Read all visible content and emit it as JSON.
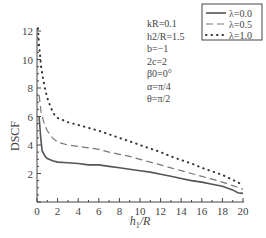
{
  "chart_data": {
    "type": "line",
    "title": "",
    "xlabel": "h1/R",
    "ylabel": "DSCF",
    "xlim": [
      0,
      20
    ],
    "ylim": [
      0,
      12
    ],
    "xticks": [
      0,
      2,
      4,
      6,
      8,
      10,
      12,
      14,
      16,
      18,
      20
    ],
    "yticks": [
      2,
      4,
      6,
      8,
      10,
      12
    ],
    "grid": false,
    "legend_position": "upper right",
    "annotations": [
      "kR=0.1",
      "h2/R=1.5",
      "b=−1",
      "2c=2",
      "β0=0°",
      "α=π/4",
      "θ=π/2"
    ],
    "series": [
      {
        "name": "λ=0.0",
        "style": "solid",
        "x": [
          0.2,
          0.35,
          0.5,
          0.8,
          1,
          1.5,
          2,
          3,
          4,
          5,
          6,
          7,
          8,
          9,
          10,
          11,
          12,
          13,
          14,
          15,
          16,
          17,
          18,
          19,
          19.5,
          20
        ],
        "y": [
          6.0,
          4.6,
          3.6,
          3.2,
          3.05,
          2.9,
          2.8,
          2.75,
          2.7,
          2.6,
          2.6,
          2.5,
          2.4,
          2.3,
          2.2,
          2.1,
          1.95,
          1.8,
          1.65,
          1.5,
          1.4,
          1.25,
          1.1,
          0.85,
          0.65,
          0.6
        ]
      },
      {
        "name": "λ=0.5",
        "style": "dashed",
        "x": [
          0.2,
          0.4,
          0.7,
          1,
          1.5,
          2,
          3,
          4,
          5,
          6,
          7,
          8,
          9,
          10,
          11,
          12,
          13,
          14,
          15,
          16,
          17,
          18,
          19,
          20
        ],
        "y": [
          7.5,
          6.3,
          5.5,
          5.0,
          4.5,
          4.2,
          4.0,
          3.9,
          3.8,
          3.7,
          3.5,
          3.35,
          3.2,
          3.0,
          2.8,
          2.6,
          2.4,
          2.2,
          2.0,
          1.8,
          1.6,
          1.4,
          1.15,
          0.9
        ]
      },
      {
        "name": "λ=1.0",
        "style": "dotted",
        "x": [
          0.1,
          0.2,
          0.4,
          0.6,
          0.8,
          1,
          1.3,
          1.6,
          2,
          3,
          4,
          5,
          6,
          7,
          8,
          9,
          10,
          11,
          12,
          13,
          14,
          15,
          16,
          17,
          18,
          19,
          20
        ],
        "y": [
          12.2,
          11.0,
          9.5,
          8.6,
          7.9,
          7.3,
          6.7,
          6.2,
          5.9,
          5.6,
          5.4,
          5.2,
          5.0,
          4.75,
          4.5,
          4.25,
          4.0,
          3.75,
          3.5,
          3.2,
          2.95,
          2.7,
          2.4,
          2.15,
          1.9,
          1.55,
          1.2
        ]
      }
    ]
  },
  "labels": {
    "ylabel": "DSCF",
    "xlabel_main": "h",
    "xlabel_sub": "1",
    "xlabel_rest": "/R"
  }
}
